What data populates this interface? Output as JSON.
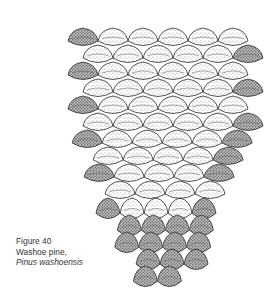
{
  "figure": {
    "style": "stippled pen-and-ink"
  },
  "caption": {
    "number": "Figure 40",
    "common_name": "Washoe pine,",
    "scientific_name": "Pinus washoensis"
  },
  "colors": {
    "ink": "#2a2a2a",
    "text": "#333333",
    "background": "#ffffff"
  }
}
